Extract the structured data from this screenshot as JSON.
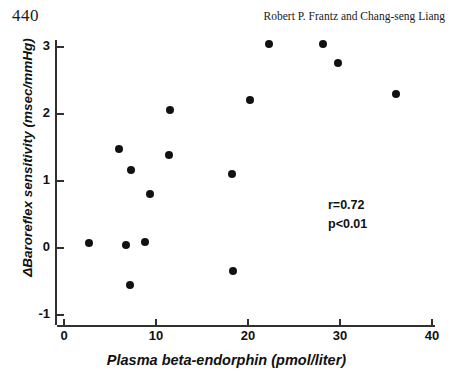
{
  "page": {
    "folio": "440",
    "running_head": "Robert P. Frantz and Chang-seng Liang"
  },
  "chart_data": {
    "type": "scatter",
    "title": "",
    "xlabel": "Plasma beta-endorphin (pmol/liter)",
    "ylabel": "ΔBaroreflex sensitivity (msec/mmHg)",
    "xlim": [
      0,
      40
    ],
    "ylim": [
      -1,
      3
    ],
    "xticks": [
      0,
      10,
      20,
      30,
      40
    ],
    "yticks": [
      -1,
      0,
      1,
      2,
      3
    ],
    "xtick_labels": [
      "0",
      "10",
      "20",
      "30",
      "40"
    ],
    "ytick_labels": [
      "-1",
      "0",
      "1",
      "2",
      "3"
    ],
    "grid": false,
    "legend": null,
    "marker": "filled-circle",
    "marker_color": "#111111",
    "points": [
      {
        "x": 2.7,
        "y": 0.08
      },
      {
        "x": 6.0,
        "y": 1.48
      },
      {
        "x": 6.7,
        "y": 0.04
      },
      {
        "x": 7.2,
        "y": -0.55
      },
      {
        "x": 7.3,
        "y": 1.17
      },
      {
        "x": 8.8,
        "y": 0.09
      },
      {
        "x": 9.4,
        "y": 0.8
      },
      {
        "x": 11.4,
        "y": 1.39
      },
      {
        "x": 11.5,
        "y": 2.06
      },
      {
        "x": 18.3,
        "y": 1.11
      },
      {
        "x": 18.4,
        "y": -0.35
      },
      {
        "x": 20.2,
        "y": 2.21
      },
      {
        "x": 22.3,
        "y": 3.04
      },
      {
        "x": 28.2,
        "y": 3.04
      },
      {
        "x": 29.8,
        "y": 2.76
      },
      {
        "x": 36.1,
        "y": 2.3
      }
    ],
    "annotations": [
      {
        "text": "r=0.72",
        "x": 30.0,
        "y": 0.72
      },
      {
        "text": "p<0.01",
        "x": 30.0,
        "y": 0.44
      }
    ]
  },
  "stats": {
    "correlation": "r=0.72",
    "pvalue": "p<0.01"
  }
}
